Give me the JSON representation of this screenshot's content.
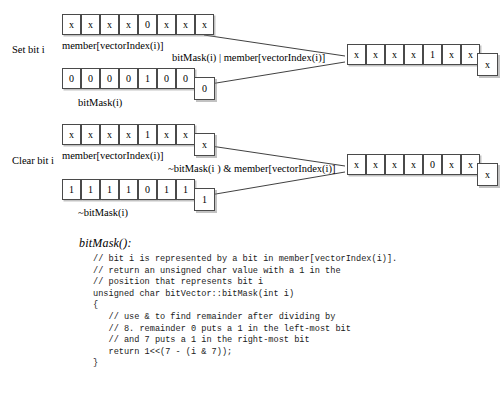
{
  "figure": {
    "sections": [
      {
        "name": "set-bit",
        "label": "Set bit i",
        "operand_a": {
          "caption": "member[vectorIndex(i)]",
          "bits": [
            "x",
            "x",
            "x",
            "x",
            "0",
            "x",
            "x",
            "x"
          ]
        },
        "operand_b": {
          "caption": "bitMask(i)",
          "bits": [
            "0",
            "0",
            "0",
            "0",
            "1",
            "0",
            "0",
            "0"
          ]
        },
        "operation_label": "bitMask(i) | member[vectorIndex(i)]",
        "result": {
          "bits": [
            "x",
            "x",
            "x",
            "x",
            "1",
            "x",
            "x",
            "x"
          ]
        }
      },
      {
        "name": "clear-bit",
        "label": "Clear bit i",
        "operand_a": {
          "caption": "member[vectorIndex(i)]",
          "bits": [
            "x",
            "x",
            "x",
            "x",
            "1",
            "x",
            "x",
            "x"
          ]
        },
        "operand_b": {
          "caption": "~bitMask(i)",
          "bits": [
            "1",
            "1",
            "1",
            "1",
            "0",
            "1",
            "1",
            "1"
          ]
        },
        "operation_label": "~bitMask(i ) & member[vectorIndex(i)]",
        "result": {
          "bits": [
            "x",
            "x",
            "x",
            "x",
            "0",
            "x",
            "x",
            "x"
          ]
        }
      }
    ]
  },
  "code": {
    "title": "bitMask():",
    "lines": [
      "// bit i is represented by a bit in member[vectorIndex(i)].",
      "// return an unsigned char value with a 1 in the",
      "// position that represents bit i",
      "unsigned char bitVector::bitMask(int i)",
      "{",
      "   // use & to find remainder after dividing by",
      "   // 8. remainder 0 puts a 1 in the left-most bit",
      "   // and 7 puts a 1 in the right-most bit",
      "   return 1<<(7 - (i & 7));",
      "}"
    ]
  },
  "colors": {
    "background": "#ffffff",
    "box_border": "#4a4a4a",
    "text": "#000000",
    "shadow": "#9a9a9a"
  }
}
